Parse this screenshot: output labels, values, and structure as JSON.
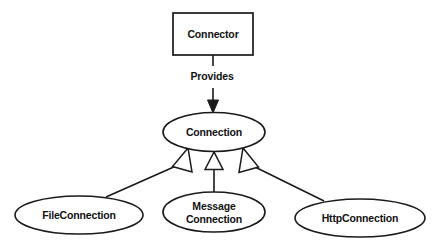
{
  "diagram": {
    "type": "uml-class-diagram",
    "background_color": "#ffffff",
    "stroke_color": "#1a1a1a",
    "fill_color": "#ffffff",
    "text_color": "#111111",
    "nodes": [
      {
        "id": "connector",
        "label": "Connector",
        "shape": "rectangle",
        "x": 173,
        "y": 13,
        "width": 80,
        "height": 42
      },
      {
        "id": "connection",
        "label": "Connection",
        "shape": "ellipse",
        "cx": 214,
        "cy": 132,
        "rx": 51,
        "ry": 19.5
      },
      {
        "id": "file-connection",
        "label": "FileConnection",
        "shape": "ellipse",
        "cx": 79,
        "cy": 215,
        "rx": 64,
        "ry": 19
      },
      {
        "id": "message-connection",
        "label": "MessageConnection",
        "label_line1": "Message",
        "label_line2": "Connection",
        "shape": "ellipse",
        "cx": 214,
        "cy": 212,
        "rx": 51,
        "ry": 20
      },
      {
        "id": "http-connection",
        "label": "HttpConnection",
        "shape": "ellipse",
        "cx": 360,
        "cy": 218,
        "rx": 65,
        "ry": 19
      }
    ],
    "edges": [
      {
        "id": "provides",
        "from": "connector",
        "to": "connection",
        "label": "Provides",
        "arrow": "solid-filled",
        "label_x": 212,
        "label_y": 77
      },
      {
        "id": "file-inherits",
        "from": "file-connection",
        "to": "connection",
        "label": "",
        "arrow": "hollow-triangle"
      },
      {
        "id": "message-inherits",
        "from": "message-connection",
        "to": "connection",
        "label": "",
        "arrow": "hollow-triangle"
      },
      {
        "id": "http-inherits",
        "from": "http-connection",
        "to": "connection",
        "label": "",
        "arrow": "hollow-triangle"
      }
    ]
  }
}
